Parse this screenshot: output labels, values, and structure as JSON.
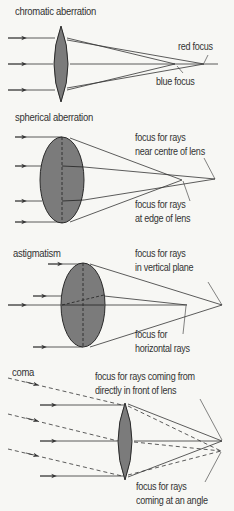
{
  "colors": {
    "background": "#f7f7f4",
    "lens_fill": "#7b7b7b",
    "lens_stroke": "#2a2a2a",
    "ray": "#333333",
    "text": "#333333"
  },
  "panels": [
    {
      "id": "chromatic",
      "title": "chromatic aberration",
      "labels": {
        "red": "red focus",
        "blue": "blue focus"
      }
    },
    {
      "id": "spherical",
      "title": "spherical aberration",
      "labels": {
        "centre_line1": "focus for rays",
        "centre_line2": "near centre of lens",
        "edge_line1": "focus for rays",
        "edge_line2": "at edge of lens"
      }
    },
    {
      "id": "astigmatism",
      "title": "astigmatism",
      "labels": {
        "vertical_line1": "focus for rays",
        "vertical_line2": "in vertical plane",
        "horizontal_line1": "focus for",
        "horizontal_line2": "horizontal rays"
      }
    },
    {
      "id": "coma",
      "title": "coma",
      "labels": {
        "direct_line1": "focus for rays coming from",
        "direct_line2": "directly in front of lens",
        "angle_line1": "focus for rays",
        "angle_line2": "coming at an angle"
      }
    }
  ]
}
